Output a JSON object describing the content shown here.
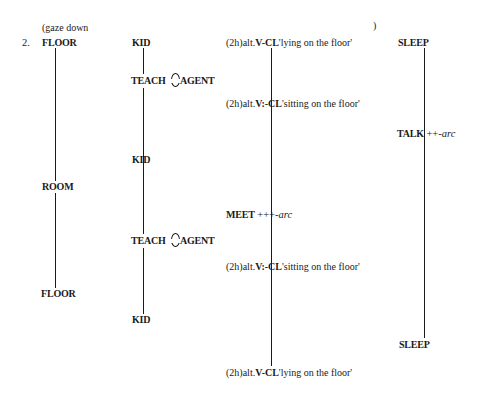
{
  "example": {
    "number": "2.",
    "nonmanual": {
      "open": "(gaze down",
      "close": ")"
    },
    "tiers": [
      {
        "id": "tier-1",
        "items": [
          {
            "gloss": "FLOOR"
          },
          {
            "gloss": "ROOM"
          },
          {
            "gloss": "FLOOR"
          }
        ]
      },
      {
        "id": "tier-2",
        "items": [
          {
            "gloss": "KID"
          },
          {
            "left": "TEACH",
            "right": "AGENT",
            "joined": true
          },
          {
            "gloss": "KID"
          },
          {
            "left": "TEACH",
            "right": "AGENT",
            "joined": true
          },
          {
            "gloss": "KID"
          }
        ]
      },
      {
        "id": "tier-3",
        "items": [
          {
            "prefix": "(2h)alt.",
            "classifier": "V-CL",
            "meaning": "'lying on the floor'"
          },
          {
            "prefix": "(2h)alt.",
            "classifier": "V:-CL",
            "meaning": "'sitting on the floor'"
          },
          {
            "gloss": "MEET",
            "suffix": "+++-",
            "modifier": "arc"
          },
          {
            "prefix": "(2h)alt.",
            "classifier": "V:-CL",
            "meaning": "'sitting on the floor'"
          },
          {
            "prefix": "(2h)alt.",
            "classifier": "V-CL",
            "meaning": "'lying on the floor'"
          }
        ]
      },
      {
        "id": "tier-4",
        "items": [
          {
            "gloss": "SLEEP"
          },
          {
            "gloss": "TALK",
            "suffix": "++-",
            "modifier": "arc"
          },
          {
            "gloss": "SLEEP"
          }
        ]
      }
    ]
  }
}
